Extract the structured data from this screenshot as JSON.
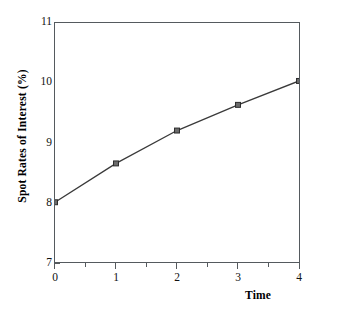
{
  "chart_data": {
    "type": "line",
    "title": "",
    "xlabel": "Time",
    "ylabel": "Spot Rates of Interest (%)",
    "x": [
      0,
      1,
      2,
      3,
      4
    ],
    "values": [
      8.0,
      8.65,
      9.2,
      9.63,
      10.03
    ],
    "series": [
      {
        "name": "Spot Rates of Interest",
        "values": [
          8.0,
          8.65,
          9.2,
          9.63,
          10.03
        ]
      }
    ],
    "xlim": [
      0,
      4
    ],
    "ylim": [
      7,
      11
    ],
    "grid": false,
    "legend": false,
    "marker": "square",
    "line_color": "#3a3a3a",
    "marker_color": "#6b6b6b",
    "marker_edge_color": "#2b2b2b",
    "axis_color": "#555a5e",
    "xticks": [
      "0",
      "1",
      "2",
      "3",
      "4"
    ],
    "yticks": [
      "7",
      "8",
      "9",
      "10",
      "11"
    ],
    "y_minor_ticks": [
      7.5,
      8.5,
      9.5,
      10.5
    ],
    "x_minor_ticks": [
      0.5,
      1.5,
      2.5,
      3.5
    ],
    "annotations": [
      {
        "text": "1st year",
        "x": 0.5
      },
      {
        "text": "2nd year",
        "x": 1.5
      },
      {
        "text": "3rd year",
        "x": 2.5
      },
      {
        "text": "4th year",
        "x": 3.5
      }
    ]
  }
}
